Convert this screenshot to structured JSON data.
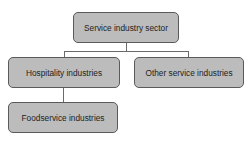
{
  "diagram": {
    "type": "hierarchy",
    "root": {
      "label": "Service industry sector"
    },
    "level2": [
      {
        "label": "Hospitality industries"
      },
      {
        "label": "Other service industries"
      }
    ],
    "level3": [
      {
        "label": "Foodservice industries",
        "parent": "Hospitality industries"
      }
    ]
  },
  "colors": {
    "node_fill": "#bcbcbc",
    "node_border": "#5a5a5a",
    "connector": "#6a6a6a"
  }
}
